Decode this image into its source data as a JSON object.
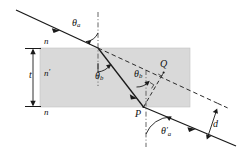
{
  "figure": {
    "name": "refraction-through-slab-diagram",
    "type": "optics-ray-diagram",
    "background_color": "#ffffff",
    "slab": {
      "fill_color": "#d9d9d9",
      "stroke_color": "#b0b0b0",
      "label_top": "n",
      "label_inside": "n",
      "label_inside_prime": "′",
      "label_bottom": "n"
    },
    "thickness_label": "t",
    "displacement_label": "d",
    "points": {
      "P": "P",
      "Q": "Q"
    },
    "angles": {
      "theta_a": "θ",
      "theta_a_sub": "a",
      "theta_b_upper": "θ",
      "theta_b_upper_sub": "b",
      "theta_b_lower": "θ",
      "theta_b_lower_sub": "b",
      "theta_a_prime": "θ",
      "theta_a_prime_mark": "′",
      "theta_a_prime_sub": "a"
    },
    "ray_color": "#1a1a1a",
    "dashed_color": "#2b2b2b",
    "normal_color": "#555555"
  }
}
